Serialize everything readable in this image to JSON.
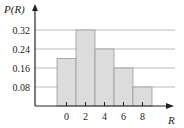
{
  "chart_data": {
    "type": "bar",
    "title": "",
    "xlabel": "R",
    "ylabel": "P(R)",
    "categories": [
      "0",
      "2",
      "4",
      "6",
      "8"
    ],
    "values": [
      0.2,
      0.32,
      0.24,
      0.16,
      0.08
    ],
    "yticks": [
      "0.08",
      "0.16",
      "0.24",
      "0.32"
    ],
    "xticks": [
      "0",
      "2",
      "4",
      "6",
      "8"
    ],
    "ylim": [
      0,
      0.36
    ],
    "grid": true,
    "legend": null
  },
  "colors": {
    "bar_fill": "#dcdcdc",
    "bar_edge": "#999999",
    "grid": "#aaaaaa",
    "axis": "#222222"
  }
}
